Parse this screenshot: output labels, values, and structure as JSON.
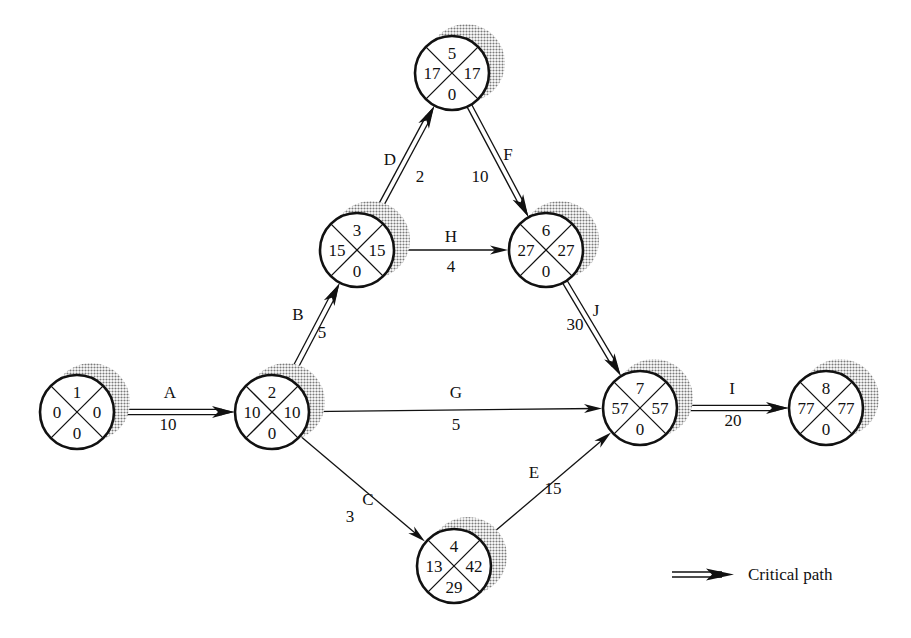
{
  "diagram": {
    "type": "activity-on-arrow network (CPM)",
    "nodes": [
      {
        "id": "1",
        "event": "1",
        "left": "0",
        "right": "0",
        "bottom": "0",
        "cx": 77,
        "cy": 412
      },
      {
        "id": "2",
        "event": "2",
        "left": "10",
        "right": "10",
        "bottom": "0",
        "cx": 272,
        "cy": 412
      },
      {
        "id": "3",
        "event": "3",
        "left": "15",
        "right": "15",
        "bottom": "0",
        "cx": 357,
        "cy": 250
      },
      {
        "id": "4",
        "event": "4",
        "left": "13",
        "right": "42",
        "bottom": "29",
        "cx": 454,
        "cy": 566
      },
      {
        "id": "5",
        "event": "5",
        "left": "17",
        "right": "17",
        "bottom": "0",
        "cx": 452,
        "cy": 73
      },
      {
        "id": "6",
        "event": "6",
        "left": "27",
        "right": "27",
        "bottom": "0",
        "cx": 546,
        "cy": 250
      },
      {
        "id": "7",
        "event": "7",
        "left": "57",
        "right": "57",
        "bottom": "0",
        "cx": 640,
        "cy": 408
      },
      {
        "id": "8",
        "event": "8",
        "left": "77",
        "right": "77",
        "bottom": "0",
        "cx": 826,
        "cy": 408
      }
    ],
    "edges": [
      {
        "activity": "A",
        "duration": "10",
        "from": "1",
        "to": "2",
        "critical": true
      },
      {
        "activity": "B",
        "duration": "5",
        "from": "2",
        "to": "3",
        "critical": true
      },
      {
        "activity": "C",
        "duration": "3",
        "from": "2",
        "to": "4",
        "critical": false
      },
      {
        "activity": "D",
        "duration": "2",
        "from": "3",
        "to": "5",
        "critical": true
      },
      {
        "activity": "E",
        "duration": "15",
        "from": "4",
        "to": "7",
        "critical": false
      },
      {
        "activity": "F",
        "duration": "10",
        "from": "5",
        "to": "6",
        "critical": true
      },
      {
        "activity": "G",
        "duration": "5",
        "from": "2",
        "to": "7",
        "critical": false
      },
      {
        "activity": "H",
        "duration": "4",
        "from": "3",
        "to": "6",
        "critical": false
      },
      {
        "activity": "I",
        "duration": "20",
        "from": "7",
        "to": "8",
        "critical": true
      },
      {
        "activity": "J",
        "duration": "30",
        "from": "6",
        "to": "7",
        "critical": true
      }
    ]
  },
  "legend": {
    "critical_path_label": "Critical path"
  },
  "colors": {
    "ink": "#111111",
    "shadow": "#9a9a9a",
    "background": "#ffffff"
  }
}
